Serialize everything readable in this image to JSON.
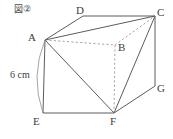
{
  "figure": {
    "caption": "図②",
    "shape_name": "cube-with-inscribed-triangle",
    "ink_color": "#4a4a4a",
    "background_color": "#ffffff",
    "dimension_label": "6 cm",
    "vertices": [
      {
        "name": "A",
        "label": "A",
        "x": 45,
        "y": 40,
        "hidden": false,
        "label_x": 28,
        "label_y": 32
      },
      {
        "name": "B",
        "label": "B",
        "x": 115,
        "y": 45,
        "hidden": true,
        "label_x": 118,
        "label_y": 42
      },
      {
        "name": "C",
        "label": "C",
        "x": 155,
        "y": 16,
        "hidden": false,
        "label_x": 157,
        "label_y": 7
      },
      {
        "name": "D",
        "label": "D",
        "x": 83,
        "y": 16,
        "hidden": false,
        "label_x": 76,
        "label_y": 5
      },
      {
        "name": "E",
        "label": "E",
        "x": 43,
        "y": 113,
        "hidden": false,
        "label_x": 33,
        "label_y": 116
      },
      {
        "name": "F",
        "label": "F",
        "x": 114,
        "y": 113,
        "hidden": false,
        "label_x": 110,
        "label_y": 116
      },
      {
        "name": "G",
        "label": "G",
        "x": 155,
        "y": 86,
        "hidden": false,
        "label_x": 157,
        "label_y": 83
      }
    ],
    "solid_edges": [
      {
        "name": "edge-A-D",
        "from": "A",
        "to": "D"
      },
      {
        "name": "edge-D-C",
        "from": "D",
        "to": "C"
      },
      {
        "name": "edge-A-C",
        "from": "A",
        "to": "C"
      },
      {
        "name": "edge-A-E",
        "from": "A",
        "to": "E"
      },
      {
        "name": "edge-E-F",
        "from": "E",
        "to": "F"
      },
      {
        "name": "edge-F-G",
        "from": "F",
        "to": "G"
      },
      {
        "name": "edge-G-C",
        "from": "G",
        "to": "C"
      },
      {
        "name": "edge-A-F",
        "from": "A",
        "to": "F"
      },
      {
        "name": "edge-F-C",
        "from": "F",
        "to": "C"
      }
    ],
    "dashed_edges": [
      {
        "name": "edge-A-B-hidden",
        "from": "A",
        "to": "B"
      },
      {
        "name": "edge-B-C-hidden",
        "from": "B",
        "to": "C"
      },
      {
        "name": "edge-B-F-hidden",
        "from": "B",
        "to": "F"
      }
    ],
    "dimension_bracket": {
      "name": "dimension-arc-A-E",
      "from_x": 45,
      "from_y": 40,
      "to_x": 43,
      "to_y": 113,
      "bulge_x": 30,
      "bulge_y": 76,
      "label_x": 12,
      "label_y": 71
    }
  }
}
